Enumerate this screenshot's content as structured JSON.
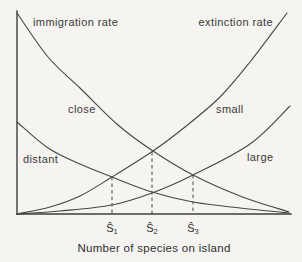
{
  "figure": {
    "rate_labels": {
      "immigration": "immigration rate",
      "extinction": "extinction rate"
    },
    "axis": {
      "x_label": "Number of species on island"
    },
    "colors": {
      "background": "#f5f4f0",
      "line": "#474747",
      "text": "#3a3a3a"
    },
    "curves": [
      {
        "id": "immigration-close",
        "label": "close",
        "points": [
          [
            17,
            13
          ],
          [
            48,
            57
          ],
          [
            80,
            88
          ],
          [
            118,
            125
          ],
          [
            153,
            151
          ],
          [
            193,
            175
          ],
          [
            240,
            196
          ],
          [
            289,
            212
          ]
        ]
      },
      {
        "id": "immigration-distant",
        "label": "distant",
        "points": [
          [
            17,
            122
          ],
          [
            48,
            148
          ],
          [
            80,
            164
          ],
          [
            112,
            177
          ],
          [
            152,
            192
          ],
          [
            193,
            202
          ],
          [
            240,
            208
          ],
          [
            289,
            213
          ]
        ]
      },
      {
        "id": "extinction-small",
        "label": "small",
        "points": [
          [
            17,
            214
          ],
          [
            50,
            207
          ],
          [
            80,
            196
          ],
          [
            112,
            177
          ],
          [
            153,
            151
          ],
          [
            185,
            127
          ],
          [
            220,
            97
          ],
          [
            250,
            62
          ],
          [
            287,
            13
          ]
        ]
      },
      {
        "id": "extinction-large",
        "label": "large",
        "points": [
          [
            17,
            214
          ],
          [
            60,
            211
          ],
          [
            112,
            205
          ],
          [
            152,
            193
          ],
          [
            193,
            175
          ],
          [
            250,
            144
          ],
          [
            290,
            106
          ]
        ]
      }
    ],
    "equilibria": [
      {
        "label": {
          "base": "Ŝ",
          "sub": "1"
        },
        "x": 112,
        "top": 177
      },
      {
        "label": {
          "base": "Ŝ",
          "sub": "2"
        },
        "x": 152,
        "top": 152
      },
      {
        "label": {
          "base": "Ŝ",
          "sub": "3"
        },
        "x": 193,
        "top": 175
      }
    ]
  }
}
